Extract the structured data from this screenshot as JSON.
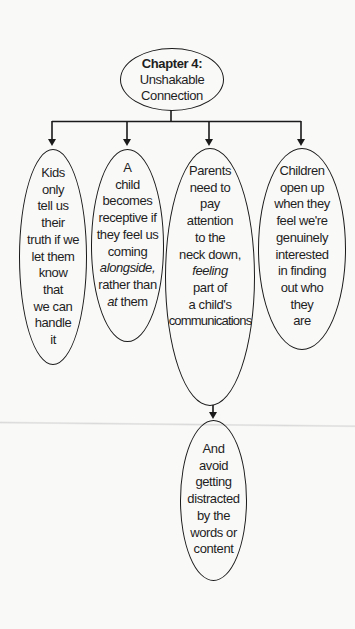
{
  "diagram": {
    "type": "tree",
    "root": {
      "title": "Chapter 4:",
      "subtitle_lines": [
        "Unshakable",
        "Connection"
      ]
    },
    "children": [
      {
        "id": "node-1",
        "lines": [
          "Kids",
          "only",
          "tell us",
          "their",
          "truth if we",
          "let them",
          "know",
          "that",
          "we can",
          "handle",
          "it"
        ]
      },
      {
        "id": "node-2",
        "lines": [
          "A",
          "child",
          "becomes",
          "receptive if",
          "they feel us",
          "coming",
          "alongside,",
          "rather than",
          "at them"
        ],
        "italic_fragments": [
          "alongside",
          "at"
        ]
      },
      {
        "id": "node-3",
        "lines": [
          "Parents",
          "need to",
          "pay",
          "attention",
          "to the",
          "neck down,",
          "feeling",
          "part of",
          "a child's",
          "communications"
        ],
        "italic_fragments": [
          "feeling"
        ],
        "child": {
          "id": "node-5",
          "lines": [
            "And",
            "avoid",
            "getting",
            "distracted",
            "by the",
            "words or",
            "content"
          ]
        }
      },
      {
        "id": "node-4",
        "lines": [
          "Children",
          "open up",
          "when they",
          "feel we're",
          "genuinely",
          "interested",
          "in finding",
          "out who",
          "they",
          "are"
        ]
      }
    ],
    "colors": {
      "background": "#f9f9f8",
      "stroke": "#1a1a1a",
      "text": "#1e1e1e"
    }
  }
}
